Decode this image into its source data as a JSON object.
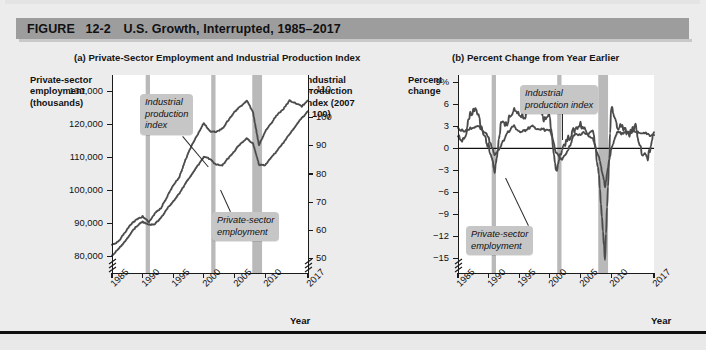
{
  "figure": {
    "label_prefix": "FIGURE",
    "number": "12-2",
    "title": "U.S. Growth, Interrupted, 1985–2017",
    "header_color": "#9d9d9e",
    "page_background": "#ececed",
    "series_color": "#4b4b4b",
    "recession_band_color": "#b9b9ba",
    "callout_background": "#c6c6c7"
  },
  "panel_a": {
    "caption": "(a) Private-Sector Employment and Industrial Production Index",
    "y_left_title": [
      "Private-sector",
      "employment",
      "(thousands)"
    ],
    "y_right_title": [
      "Industrial",
      "production",
      "index (2007",
      "= 100)"
    ],
    "x_title": "Year",
    "y_left_ticks": [
      "130,000",
      "120,000",
      "110,000",
      "100,000",
      "90,000",
      "80,000"
    ],
    "y_right_ticks": [
      "110",
      "100",
      "90",
      "80",
      "70",
      "60",
      "50"
    ],
    "x_ticks": [
      "1985",
      "1990",
      "1995",
      "2000",
      "2005",
      "2010",
      "2017"
    ],
    "callouts": [
      {
        "name": "industrial-production-index",
        "lines": [
          "Industrial",
          "production",
          "index"
        ]
      },
      {
        "name": "private-sector-employment",
        "lines": [
          "Private-sector",
          "employment"
        ]
      }
    ],
    "axis_break_left": true,
    "axis_break_right": true
  },
  "panel_b": {
    "caption": "(b) Percent Change from Year Earlier",
    "y_left_title": [
      "Percent",
      "change"
    ],
    "x_title": "Year",
    "y_ticks": [
      "9%",
      "6",
      "3",
      "0",
      "−3",
      "−6",
      "−9",
      "−12",
      "−15"
    ],
    "x_ticks": [
      "1985",
      "1990",
      "1995",
      "2000",
      "2005",
      "2010",
      "2017"
    ],
    "callouts": [
      {
        "name": "industrial-production-index",
        "lines": [
          "Industrial",
          "production index"
        ]
      },
      {
        "name": "private-sector-employment",
        "lines": [
          "Private-sector",
          "employment"
        ]
      }
    ],
    "axis_break_left": true
  },
  "chart_data": [
    {
      "type": "line",
      "name": "panel-a",
      "title": "(a) Private-Sector Employment and Industrial Production Index",
      "xlabel": "Year",
      "ylabel": "Private-sector employment (thousands)",
      "ylabel_right": "Industrial production index (2007 = 100)",
      "xlim": [
        1985,
        2017
      ],
      "ylim": [
        75000,
        135000
      ],
      "ylim_right": [
        45,
        115
      ],
      "grid": false,
      "legend": "inline-callouts",
      "recessions": [
        [
          1990.5,
          1991.2
        ],
        [
          2001.2,
          2001.9
        ],
        [
          2007.9,
          2009.5
        ]
      ],
      "series": [
        {
          "name": "Private-sector employment",
          "axis": "left",
          "unit": "thousands",
          "x": [
            1985,
            1986,
            1987,
            1988,
            1989,
            1990,
            1991,
            1992,
            1993,
            1994,
            1995,
            1996,
            1997,
            1998,
            1999,
            2000,
            2001,
            2002,
            2003,
            2004,
            2005,
            2006,
            2007,
            2008,
            2009,
            2010,
            2011,
            2012,
            2013,
            2014,
            2015,
            2016,
            2017
          ],
          "values": [
            80300,
            82100,
            84300,
            86900,
            89200,
            90500,
            89600,
            89900,
            91700,
            94500,
            96800,
            99100,
            102100,
            104900,
            107500,
            110100,
            109600,
            107800,
            107700,
            109800,
            112000,
            114300,
            115700,
            114400,
            107800,
            107600,
            109900,
            112200,
            114500,
            117200,
            119700,
            122000,
            124000
          ],
          "style": "solid-thick"
        },
        {
          "name": "Industrial production index",
          "axis": "right",
          "unit": "index 2007 = 100",
          "x": [
            1985,
            1986,
            1987,
            1988,
            1989,
            1990,
            1991,
            1992,
            1993,
            1994,
            1995,
            1996,
            1997,
            1998,
            1999,
            2000,
            2001,
            2002,
            2003,
            2004,
            2005,
            2006,
            2007,
            2008,
            2009,
            2010,
            2011,
            2012,
            2013,
            2014,
            2015,
            2016,
            2017
          ],
          "values": [
            55,
            56,
            59,
            62,
            64,
            65,
            63,
            66,
            68,
            72,
            76,
            79,
            85,
            90,
            94,
            98,
            95,
            95,
            96,
            99,
            102,
            104,
            106,
            102,
            90,
            95,
            98,
            101,
            103,
            106,
            105,
            104,
            106
          ],
          "style": "solid-thick"
        }
      ]
    },
    {
      "type": "line",
      "name": "panel-b",
      "title": "(b) Percent Change from Year Earlier",
      "xlabel": "Year",
      "ylabel": "Percent change",
      "xlim": [
        1985,
        2017
      ],
      "ylim": [
        -17,
        10
      ],
      "grid": false,
      "zero_line": true,
      "legend": "inline-callouts",
      "recessions": [
        [
          1990.5,
          1991.2
        ],
        [
          2001.2,
          2001.9
        ],
        [
          2007.9,
          2009.5
        ]
      ],
      "series": [
        {
          "name": "Private-sector employment",
          "unit": "percent change from year earlier",
          "x": [
            1985,
            1986,
            1987,
            1988,
            1989,
            1990,
            1991,
            1992,
            1993,
            1994,
            1995,
            1996,
            1997,
            1998,
            1999,
            2000,
            2001,
            2002,
            2003,
            2004,
            2005,
            2006,
            2007,
            2008,
            2009,
            2010,
            2011,
            2012,
            2013,
            2014,
            2015,
            2016,
            2017
          ],
          "values": [
            2.8,
            2.2,
            2.7,
            3.1,
            2.6,
            1.4,
            -1.0,
            0.4,
            2.0,
            3.1,
            2.4,
            2.4,
            3.0,
            2.7,
            2.5,
            2.4,
            -0.5,
            -1.6,
            -0.1,
            1.9,
            2.0,
            2.1,
            1.2,
            -1.1,
            -5.2,
            -0.2,
            2.1,
            2.1,
            2.1,
            2.4,
            2.2,
            1.9,
            1.8
          ],
          "style": "solid-thick"
        },
        {
          "name": "Industrial production index",
          "unit": "percent change from year earlier",
          "x": [
            1985,
            1986,
            1987,
            1988,
            1989,
            1990,
            1991,
            1992,
            1993,
            1994,
            1995,
            1996,
            1997,
            1998,
            1999,
            2000,
            2001,
            2002,
            2003,
            2004,
            2005,
            2006,
            2007,
            2008,
            2009,
            2010,
            2011,
            2012,
            2013,
            2014,
            2015,
            2016,
            2017
          ],
          "values": [
            1.6,
            1.0,
            4.8,
            5.3,
            2.5,
            0.3,
            -3.2,
            3.2,
            3.5,
            5.3,
            4.6,
            4.4,
            7.0,
            5.5,
            4.0,
            4.3,
            -3.4,
            0.2,
            1.3,
            2.5,
            3.3,
            2.2,
            2.7,
            -3.6,
            -15.5,
            5.7,
            3.0,
            2.8,
            1.9,
            3.1,
            -0.7,
            -1.2,
            2.2
          ],
          "style": "solid-thick"
        }
      ]
    }
  ]
}
